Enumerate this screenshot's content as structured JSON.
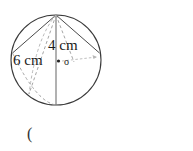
{
  "figure": {
    "kind": "geometry-diagram",
    "shape": "sphere-with-inscribed-cone",
    "outline_color": "#3a3a3a",
    "dashed_color": "#9a9a9a",
    "solid_chord_color": "#4a4a4a",
    "labels": {
      "slant_height": "4 cm",
      "diameter": "6 cm",
      "center_marker": "o"
    },
    "geometry": {
      "circle_center_x": 56,
      "circle_center_y": 60,
      "circle_radius": 45,
      "apex_x": 56,
      "apex_y": 15,
      "bottom_x": 56,
      "bottom_y": 105
    }
  },
  "caption": {
    "text": "("
  }
}
